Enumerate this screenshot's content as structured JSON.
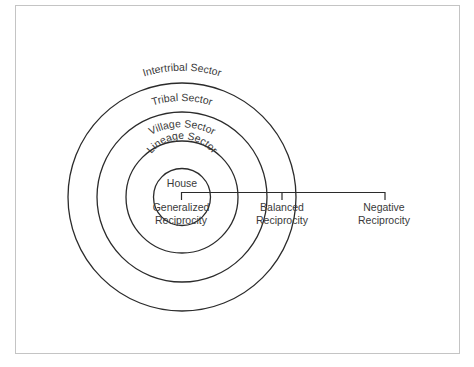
{
  "diagram": {
    "sectors": [
      {
        "id": "intertribal",
        "label": "Intertribal Sector",
        "radius": 114
      },
      {
        "id": "tribal",
        "label": "Tribal Sector",
        "radius": 85
      },
      {
        "id": "village",
        "label": "Village Sector",
        "radius": 56
      },
      {
        "id": "lineage",
        "label": "Lineage Sector",
        "radius": 28
      }
    ],
    "center_label": "House",
    "reciprocity": [
      {
        "id": "generalized",
        "line1": "Generalized",
        "line2": "Reciprocity"
      },
      {
        "id": "balanced",
        "line1": "Balanced",
        "line2": "Reciprocity"
      },
      {
        "id": "negative",
        "line1": "Negative",
        "line2": "Reciprocity"
      }
    ],
    "colors": {
      "stroke": "#2b2b2b",
      "text": "#3a3a3a",
      "frame": "#c4c4c4",
      "background": "#ffffff"
    }
  }
}
